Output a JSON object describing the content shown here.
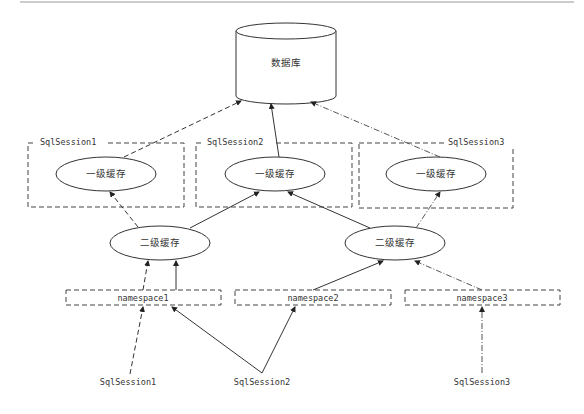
{
  "diagram": {
    "database": {
      "label": "数据库"
    },
    "sessions": [
      {
        "box_label": "SqlSession1",
        "cache_label": "一级缓存"
      },
      {
        "box_label": "SqlSession2",
        "cache_label": "一级缓存"
      },
      {
        "box_label": "SqlSession3",
        "cache_label": "一级缓存"
      }
    ],
    "second_level_caches": [
      {
        "label": "二级缓存"
      },
      {
        "label": "二级缓存"
      }
    ],
    "namespaces": [
      {
        "label": "namespace1"
      },
      {
        "label": "namespace2"
      },
      {
        "label": "namespace3"
      }
    ],
    "clients": [
      {
        "label": "SqlSession1"
      },
      {
        "label": "SqlSession2"
      },
      {
        "label": "SqlSession3"
      }
    ],
    "colors": {
      "stroke": "#333333",
      "background": "#ffffff",
      "top_rule": "#999999"
    }
  }
}
